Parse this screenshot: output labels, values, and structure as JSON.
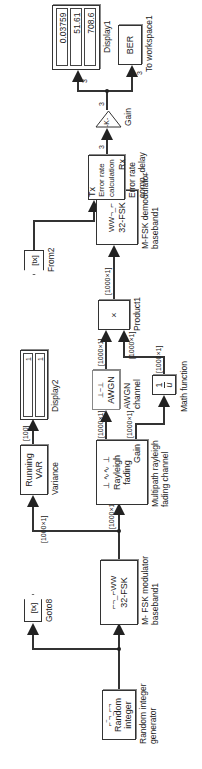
{
  "diagram": {
    "orientation": "rotated-90-ccw",
    "blocks": {
      "random_integer": {
        "line1": "Random",
        "line2": "integer",
        "caption1": "Random integer",
        "caption2": "generator"
      },
      "goto8": {
        "tag": "[tx]",
        "caption": "Goto8"
      },
      "fsk_mod": {
        "text": "32-FSK",
        "caption1": "M- FSK modulator",
        "caption2": "baseband1"
      },
      "running_var": {
        "line1": "Running",
        "line2": "VAR",
        "caption": "Variance"
      },
      "display2": {
        "values": [
          "1",
          "1"
        ],
        "caption": "Display2"
      },
      "rayleigh": {
        "line1": "Rayleigh",
        "line2": "fading",
        "line3": "Gain",
        "caption1": "Multipath rayleigh",
        "caption2": "fading channel"
      },
      "awgn": {
        "text": "AWGN",
        "caption1": "AWGN",
        "caption2": "channel"
      },
      "math_function": {
        "num": "1",
        "den": "u",
        "caption": "Math function"
      },
      "product1": {
        "symbol": "×",
        "caption": "Product1"
      },
      "fsk_demod": {
        "text": "32-FSK",
        "caption1": "M-FSK demodulator",
        "caption2": "baseband1"
      },
      "from2": {
        "tag": "[tx]",
        "caption": "From2"
      },
      "error_rate": {
        "port_tx": "Tx",
        "port_rx": "Rx",
        "line1": "Error rate",
        "line2": "calculation",
        "caption1": "Error rate",
        "caption2": "comp_delay"
      },
      "gain": {
        "text": "-K-",
        "caption": "Gain"
      },
      "display1": {
        "values": [
          "0.03759",
          "51.61",
          "708.6"
        ],
        "caption": "Display1"
      },
      "to_workspace1": {
        "text": "BER",
        "caption": "To workspace1"
      }
    },
    "signals": {
      "mod_to_var": "[1000×1]",
      "mod_to_rayleigh": "[1000×1]",
      "var_to_display2": "[100]",
      "rayleigh_to_awgn": "[1000×1]",
      "rayleigh_gain_to_math": "[1000×1]",
      "awgn_to_product": "[1000×1]",
      "math_to_product_a": "[1000×1]",
      "math_to_product_b": "[1000×1]",
      "product_to_demod": "[1000×1]",
      "error_to_gain": "3",
      "gain_out": "3",
      "to_display1": "3",
      "to_workspace": "3"
    }
  }
}
